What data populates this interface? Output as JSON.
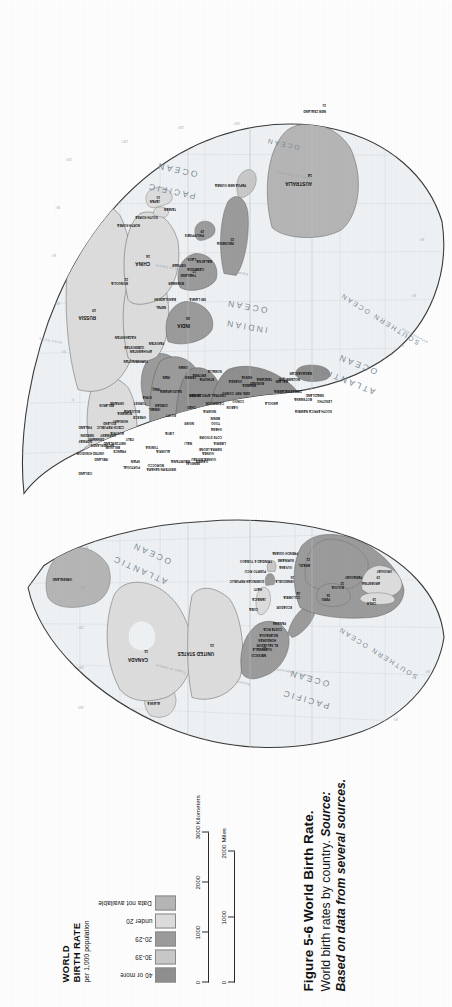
{
  "figure": {
    "label": "Figure",
    "number": "5-6",
    "title": "World Birth Rate.",
    "description": "World birth rates by country.",
    "source_label": "Source:",
    "source_text": "Based on data from several sources."
  },
  "legend": {
    "title_line1": "WORLD",
    "title_line2": "BIRTH RATE",
    "subtitle": "per 1,000 population",
    "classes": [
      {
        "label": "40 or more",
        "color": "#8f8f8f"
      },
      {
        "label": "30-39",
        "color": "#c8c8c8"
      },
      {
        "label": "20-29",
        "color": "#9b9b9b"
      },
      {
        "label": "under 20",
        "color": "#dcdcdc"
      },
      {
        "label": "Data not available",
        "color": "#b5b5b5"
      }
    ]
  },
  "scale_bar": {
    "km_ticks": [
      "0",
      "1000",
      "2000",
      "3000"
    ],
    "km_unit": "Kilometers",
    "mi_ticks": [
      "0",
      "1000",
      "2000"
    ],
    "mi_unit": "Miles"
  },
  "map": {
    "projection": "interrupted-goode-homolosine",
    "oceans": [
      {
        "name": "PACIFIC OCEAN"
      },
      {
        "name": "ATLANTIC OCEAN"
      },
      {
        "name": "INDIAN OCEAN"
      },
      {
        "name": "SOUTHERN OCEAN"
      },
      {
        "name": "ARCTIC OCEAN"
      }
    ],
    "reference_lines": [
      "Tropic of Cancer",
      "Equator",
      "Tropic of Capricorn",
      "Arctic Circle",
      "Antarctic Circle"
    ],
    "graticule_labels": [
      "160°",
      "140°",
      "120°",
      "100°",
      "80°",
      "60°",
      "40°",
      "20°",
      "0°",
      "20°",
      "40°",
      "60°",
      "80°",
      "100°",
      "120°",
      "140°",
      "160°"
    ],
    "countries": [
      {
        "name": "CANADA",
        "value": "11",
        "class": "under 20"
      },
      {
        "name": "UNITED STATES",
        "value": "15",
        "class": "under 20"
      },
      {
        "name": "MEXICO",
        "value": "27",
        "class": "20-29"
      },
      {
        "name": "GREENLAND",
        "value": "",
        "class": "Data not available"
      },
      {
        "name": "GUATEMALA",
        "value": "35",
        "class": "30-39"
      },
      {
        "name": "EL SALVADOR",
        "value": "30",
        "class": "30-39"
      },
      {
        "name": "HONDURAS",
        "value": "37",
        "class": "30-39"
      },
      {
        "name": "NICARAGUA",
        "value": "38",
        "class": "30-39"
      },
      {
        "name": "COSTA RICA",
        "value": "26",
        "class": "20-29"
      },
      {
        "name": "PANAMA",
        "value": "25",
        "class": "20-29"
      },
      {
        "name": "CUBA",
        "value": "17",
        "class": "under 20"
      },
      {
        "name": "JAMAICA",
        "value": "24",
        "class": "20-29"
      },
      {
        "name": "HAITI",
        "value": "35",
        "class": "30-39"
      },
      {
        "name": "DOMINICAN REPUBLIC",
        "value": "27",
        "class": "20-29"
      },
      {
        "name": "PUERTO RICO",
        "value": "18",
        "class": "under 20"
      },
      {
        "name": "TRINIDAD & TOBAGO",
        "value": "18",
        "class": "under 20"
      },
      {
        "name": "COLOMBIA",
        "value": "24",
        "class": "20-29"
      },
      {
        "name": "VENEZUELA",
        "value": "26",
        "class": "20-29"
      },
      {
        "name": "GUYANA",
        "value": "25",
        "class": "20-29"
      },
      {
        "name": "SURINAME",
        "value": "25",
        "class": "20-29"
      },
      {
        "name": "FRENCH GUIANA",
        "value": "",
        "class": "Data not available"
      },
      {
        "name": "ECUADOR",
        "value": "26",
        "class": "20-29"
      },
      {
        "name": "PERU",
        "value": "26",
        "class": "20-29"
      },
      {
        "name": "BOLIVIA",
        "value": "32",
        "class": "30-39"
      },
      {
        "name": "BRAZIL",
        "value": "21",
        "class": "20-29"
      },
      {
        "name": "PARAGUAY",
        "value": "31",
        "class": "30-39"
      },
      {
        "name": "CHILE",
        "value": "19",
        "class": "under 20"
      },
      {
        "name": "ARGENTINA",
        "value": "19",
        "class": "under 20"
      },
      {
        "name": "URUGUAY",
        "value": "17",
        "class": "under 20"
      },
      {
        "name": "ICELAND",
        "value": "15",
        "class": "under 20"
      },
      {
        "name": "IRELAND",
        "value": "14",
        "class": "under 20"
      },
      {
        "name": "UNITED KINGDOM",
        "value": "13",
        "class": "under 20"
      },
      {
        "name": "NORWAY",
        "value": "13",
        "class": "under 20"
      },
      {
        "name": "SWEDEN",
        "value": "11",
        "class": "under 20"
      },
      {
        "name": "FINLAND",
        "value": "11",
        "class": "under 20"
      },
      {
        "name": "DENMARK",
        "value": "12",
        "class": "under 20"
      },
      {
        "name": "NETHERLANDS",
        "value": "12",
        "class": "under 20"
      },
      {
        "name": "BELGIUM",
        "value": "11",
        "class": "under 20"
      },
      {
        "name": "GERMANY",
        "value": "9",
        "class": "under 20"
      },
      {
        "name": "FRANCE",
        "value": "13",
        "class": "under 20"
      },
      {
        "name": "SPAIN",
        "value": "9",
        "class": "under 20"
      },
      {
        "name": "PORTUGAL",
        "value": "11",
        "class": "under 20"
      },
      {
        "name": "ITALY",
        "value": "9",
        "class": "under 20"
      },
      {
        "name": "SWITZERLAND",
        "value": "11",
        "class": "under 20"
      },
      {
        "name": "AUSTRIA",
        "value": "10",
        "class": "under 20"
      },
      {
        "name": "POLAND",
        "value": "10",
        "class": "under 20"
      },
      {
        "name": "CZECH REPUBLIC",
        "value": "9",
        "class": "under 20"
      },
      {
        "name": "HUNGARY",
        "value": "10",
        "class": "under 20"
      },
      {
        "name": "ROMANIA",
        "value": "11",
        "class": "under 20"
      },
      {
        "name": "BULGARIA",
        "value": "9",
        "class": "under 20"
      },
      {
        "name": "GREECE",
        "value": "10",
        "class": "under 20"
      },
      {
        "name": "UKRAINE",
        "value": "9",
        "class": "under 20"
      },
      {
        "name": "BELARUS",
        "value": "9",
        "class": "under 20"
      },
      {
        "name": "RUSSIA",
        "value": "10",
        "class": "under 20"
      },
      {
        "name": "TURKEY",
        "value": "20",
        "class": "20-29"
      },
      {
        "name": "SYRIA",
        "value": "30",
        "class": "30-39"
      },
      {
        "name": "IRAQ",
        "value": "34",
        "class": "30-39"
      },
      {
        "name": "IRAN",
        "value": "19",
        "class": "under 20"
      },
      {
        "name": "SAUDI ARABIA",
        "value": "30",
        "class": "30-39"
      },
      {
        "name": "YEMEN",
        "value": "43",
        "class": "40 or more"
      },
      {
        "name": "OMAN",
        "value": "36",
        "class": "30-39"
      },
      {
        "name": "ISRAEL",
        "value": "20",
        "class": "20-29"
      },
      {
        "name": "JORDAN",
        "value": "28",
        "class": "20-29"
      },
      {
        "name": "EGYPT",
        "value": "25",
        "class": "20-29"
      },
      {
        "name": "LIBYA",
        "value": "27",
        "class": "20-29"
      },
      {
        "name": "ALGERIA",
        "value": "23",
        "class": "20-29"
      },
      {
        "name": "MOROCCO",
        "value": "23",
        "class": "20-29"
      },
      {
        "name": "TUNISIA",
        "value": "17",
        "class": "under 20"
      },
      {
        "name": "WESTERN SAHARA",
        "value": "",
        "class": "Data not available"
      },
      {
        "name": "MAURITANIA",
        "value": "42",
        "class": "40 or more"
      },
      {
        "name": "MALI",
        "value": "49",
        "class": "40 or more"
      },
      {
        "name": "NIGER",
        "value": "54",
        "class": "40 or more"
      },
      {
        "name": "CHAD",
        "value": "48",
        "class": "40 or more"
      },
      {
        "name": "SUDAN",
        "value": "38",
        "class": "30-39"
      },
      {
        "name": "ERITREA",
        "value": "40",
        "class": "40 or more"
      },
      {
        "name": "ETHIOPIA",
        "value": "44",
        "class": "40 or more"
      },
      {
        "name": "SOMALIA",
        "value": "47",
        "class": "40 or more"
      },
      {
        "name": "SENEGAL",
        "value": "38",
        "class": "30-39"
      },
      {
        "name": "GAMBIA",
        "value": "41",
        "class": "40 or more"
      },
      {
        "name": "GUINEA-BISSAU",
        "value": "42",
        "class": "40 or more"
      },
      {
        "name": "GUINEA",
        "value": "43",
        "class": "40 or more"
      },
      {
        "name": "SIERRA LEONE",
        "value": "45",
        "class": "40 or more"
      },
      {
        "name": "LIBERIA",
        "value": "45",
        "class": "40 or more"
      },
      {
        "name": "COTE D'IVOIRE",
        "value": "37",
        "class": "30-39"
      },
      {
        "name": "GHANA",
        "value": "33",
        "class": "30-39"
      },
      {
        "name": "TOGO",
        "value": "38",
        "class": "30-39"
      },
      {
        "name": "BENIN",
        "value": "42",
        "class": "40 or more"
      },
      {
        "name": "NIGERIA",
        "value": "41",
        "class": "40 or more"
      },
      {
        "name": "CAMEROON",
        "value": "36",
        "class": "30-39"
      },
      {
        "name": "CENTRAL AFRICAN REP.",
        "value": "37",
        "class": "30-39"
      },
      {
        "name": "GABON",
        "value": "36",
        "class": "30-39"
      },
      {
        "name": "CONGO",
        "value": "44",
        "class": "40 or more"
      },
      {
        "name": "DEM. REP. CONGO",
        "value": "45",
        "class": "40 or more"
      },
      {
        "name": "UGANDA",
        "value": "48",
        "class": "40 or more"
      },
      {
        "name": "KENYA",
        "value": "34",
        "class": "30-39"
      },
      {
        "name": "RWANDA",
        "value": "40",
        "class": "40 or more"
      },
      {
        "name": "BURUNDI",
        "value": "40",
        "class": "40 or more"
      },
      {
        "name": "TANZANIA",
        "value": "39",
        "class": "30-39"
      },
      {
        "name": "ANGOLA",
        "value": "46",
        "class": "40 or more"
      },
      {
        "name": "ZAMBIA",
        "value": "41",
        "class": "40 or more"
      },
      {
        "name": "MALAWI",
        "value": "44",
        "class": "40 or more"
      },
      {
        "name": "MOZAMBIQUE",
        "value": "40",
        "class": "40 or more"
      },
      {
        "name": "ZIMBABWE",
        "value": "30",
        "class": "30-39"
      },
      {
        "name": "BOTSWANA",
        "value": "31",
        "class": "30-39"
      },
      {
        "name": "NAMIBIA",
        "value": "35",
        "class": "30-39"
      },
      {
        "name": "SOUTH AFRICA",
        "value": "25",
        "class": "20-29"
      },
      {
        "name": "LESOTHO",
        "value": "32",
        "class": "30-39"
      },
      {
        "name": "SWAZILAND",
        "value": "34",
        "class": "30-39"
      },
      {
        "name": "MADAGASCAR",
        "value": "43",
        "class": "40 or more"
      },
      {
        "name": "KAZAKHSTAN",
        "value": "15",
        "class": "under 20"
      },
      {
        "name": "UZBEKISTAN",
        "value": "23",
        "class": "20-29"
      },
      {
        "name": "TURKMENISTAN",
        "value": "21",
        "class": "20-29"
      },
      {
        "name": "AFGHANISTAN",
        "value": "43",
        "class": "40 or more"
      },
      {
        "name": "PAKISTAN",
        "value": "36",
        "class": "30-39"
      },
      {
        "name": "INDIA",
        "value": "26",
        "class": "20-29"
      },
      {
        "name": "NEPAL",
        "value": "35",
        "class": "30-39"
      },
      {
        "name": "BANGLADESH",
        "value": "27",
        "class": "20-29"
      },
      {
        "name": "SRI LANKA",
        "value": "18",
        "class": "under 20"
      },
      {
        "name": "MYANMAR",
        "value": "25",
        "class": "20-29"
      },
      {
        "name": "THAILAND",
        "value": "17",
        "class": "under 20"
      },
      {
        "name": "CAMBODIA",
        "value": "38",
        "class": "30-39"
      },
      {
        "name": "VIETNAM",
        "value": "22",
        "class": "20-29"
      },
      {
        "name": "LAOS",
        "value": "39",
        "class": "30-39"
      },
      {
        "name": "MALAYSIA",
        "value": "25",
        "class": "20-29"
      },
      {
        "name": "INDONESIA",
        "value": "23",
        "class": "20-29"
      },
      {
        "name": "PHILIPPINES",
        "value": "29",
        "class": "20-29"
      },
      {
        "name": "CHINA",
        "value": "16",
        "class": "under 20"
      },
      {
        "name": "MONGOLIA",
        "value": "22",
        "class": "20-29"
      },
      {
        "name": "NORTH KOREA",
        "value": "21",
        "class": "20-29"
      },
      {
        "name": "SOUTH KOREA",
        "value": "15",
        "class": "under 20"
      },
      {
        "name": "JAPAN",
        "value": "10",
        "class": "under 20"
      },
      {
        "name": "TAIWAN",
        "value": "14",
        "class": "under 20"
      },
      {
        "name": "PAPUA NEW GUINEA",
        "value": "33",
        "class": "30-39"
      },
      {
        "name": "AUSTRALIA",
        "value": "14",
        "class": "under 20"
      },
      {
        "name": "NEW ZEALAND",
        "value": "15",
        "class": "under 20"
      }
    ]
  }
}
